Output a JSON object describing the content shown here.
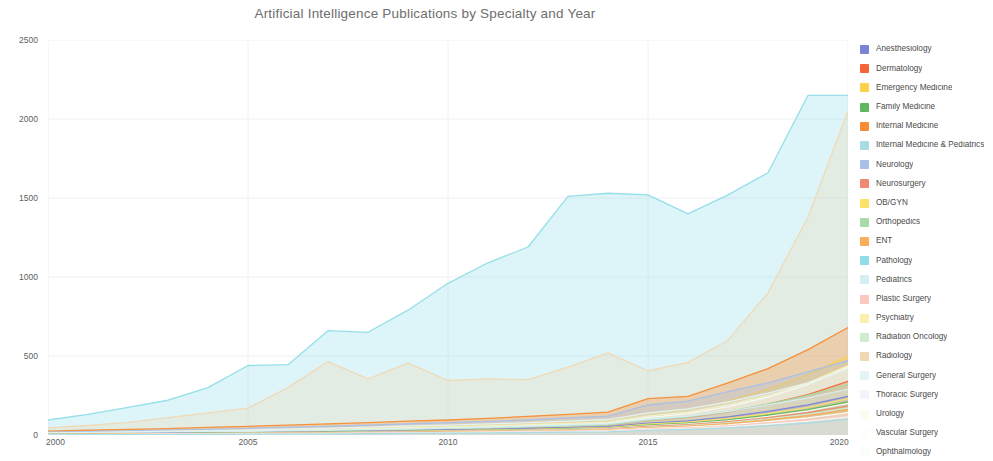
{
  "title": "Artificial Intelligence Publications by Specialty and Year",
  "axes": {
    "y_ticks": [
      0,
      500,
      1000,
      1500,
      2000,
      2500
    ],
    "x_ticks": [
      2000,
      2005,
      2010,
      2015,
      2020
    ]
  },
  "legend": {
    "position": "right",
    "items": [
      {
        "label": "Anesthesiology",
        "color": "#7b84d4"
      },
      {
        "label": "Dermatology",
        "color": "#f4663a"
      },
      {
        "label": "Emergency Medicine",
        "color": "#fbd04a"
      },
      {
        "label": "Family Medicine",
        "color": "#5fb85f"
      },
      {
        "label": "Internal Medicine",
        "color": "#f78c34"
      },
      {
        "label": "Internal Medicine & Pediatrics",
        "color": "#a8dbe3"
      },
      {
        "label": "Neurology",
        "color": "#a8c0e8"
      },
      {
        "label": "Neurosurgery",
        "color": "#f08a72"
      },
      {
        "label": "OB/GYN",
        "color": "#fbe26a"
      },
      {
        "label": "Orthopedics",
        "color": "#a8dba8"
      },
      {
        "label": "ENT",
        "color": "#f9ae5c"
      },
      {
        "label": "Pathology",
        "color": "#8fdde8"
      },
      {
        "label": "Pediatrics",
        "color": "#d4eef2"
      },
      {
        "label": "Plastic Surgery",
        "color": "#f9c9c0"
      },
      {
        "label": "Psychiatry",
        "color": "#fbefae"
      },
      {
        "label": "Radiation Oncology",
        "color": "#cfeccf"
      },
      {
        "label": "Radiology",
        "color": "#f0d8b4"
      },
      {
        "label": "General Surgery",
        "color": "#e4f4f6"
      },
      {
        "label": "Thoracic Surgery",
        "color": "#f2f6fb"
      },
      {
        "label": "Urology",
        "color": "#fdfaf0"
      },
      {
        "label": "Vascular Surgery",
        "color": "#fdfdfa"
      },
      {
        "label": "Ophthalmology",
        "color": "#fbfdfb"
      }
    ]
  },
  "chart_data": {
    "type": "area",
    "title": "Artificial Intelligence Publications by Specialty and Year",
    "xlabel": "",
    "ylabel": "",
    "xlim": [
      2000,
      2020
    ],
    "ylim": [
      0,
      2500
    ],
    "grid": true,
    "legend_position": "right",
    "x": [
      2000,
      2001,
      2002,
      2003,
      2004,
      2005,
      2006,
      2007,
      2008,
      2009,
      2010,
      2011,
      2012,
      2013,
      2014,
      2015,
      2016,
      2017,
      2018,
      2019,
      2020
    ],
    "series": [
      {
        "name": "Pathology",
        "color": "#8fdde8",
        "values": [
          95,
          130,
          175,
          220,
          300,
          440,
          445,
          660,
          650,
          790,
          960,
          1090,
          1190,
          1510,
          1530,
          1520,
          1400,
          1520,
          1660,
          2150,
          2150
        ]
      },
      {
        "name": "Radiology",
        "color": "#f0d8b4",
        "values": [
          45,
          60,
          80,
          110,
          140,
          170,
          300,
          465,
          355,
          455,
          345,
          355,
          350,
          430,
          520,
          405,
          460,
          600,
          900,
          1380,
          2050
        ]
      },
      {
        "name": "Internal Medicine",
        "color": "#f78c34",
        "values": [
          25,
          30,
          35,
          40,
          48,
          55,
          62,
          70,
          78,
          88,
          95,
          105,
          118,
          130,
          145,
          230,
          245,
          330,
          420,
          540,
          680
        ]
      },
      {
        "name": "Neurology",
        "color": "#a8c0e8",
        "values": [
          18,
          22,
          26,
          30,
          36,
          42,
          48,
          55,
          62,
          70,
          78,
          86,
          96,
          108,
          120,
          190,
          215,
          275,
          330,
          400,
          470
        ]
      },
      {
        "name": "Emergency Medicine",
        "color": "#fbd04a",
        "values": [
          12,
          15,
          18,
          22,
          26,
          30,
          34,
          40,
          45,
          52,
          58,
          64,
          72,
          80,
          90,
          135,
          160,
          215,
          290,
          380,
          500
        ]
      },
      {
        "name": "Psychiatry",
        "color": "#fbefae",
        "values": [
          10,
          13,
          16,
          19,
          23,
          27,
          31,
          36,
          41,
          47,
          52,
          58,
          65,
          73,
          82,
          120,
          145,
          190,
          250,
          330,
          440
        ]
      },
      {
        "name": "General Surgery",
        "color": "#e4f4f6",
        "values": [
          14,
          17,
          20,
          24,
          28,
          33,
          38,
          44,
          50,
          57,
          63,
          70,
          78,
          88,
          98,
          140,
          165,
          210,
          265,
          330,
          420
        ]
      },
      {
        "name": "Ophthalmology",
        "color": "#fbfdfb",
        "values": [
          8,
          10,
          12,
          15,
          18,
          21,
          25,
          29,
          34,
          39,
          44,
          50,
          57,
          65,
          74,
          110,
          135,
          180,
          240,
          320,
          430
        ]
      },
      {
        "name": "Dermatology",
        "color": "#f4663a",
        "values": [
          6,
          8,
          10,
          12,
          14,
          17,
          20,
          23,
          27,
          31,
          35,
          40,
          46,
          52,
          60,
          90,
          110,
          145,
          195,
          255,
          340
        ]
      },
      {
        "name": "Orthopedics",
        "color": "#a8dba8",
        "values": [
          7,
          9,
          11,
          13,
          16,
          19,
          22,
          26,
          30,
          34,
          39,
          44,
          50,
          57,
          65,
          95,
          115,
          150,
          195,
          250,
          320
        ]
      },
      {
        "name": "Pediatrics",
        "color": "#d4eef2",
        "values": [
          9,
          11,
          13,
          16,
          19,
          22,
          26,
          30,
          34,
          39,
          44,
          50,
          56,
          64,
          72,
          100,
          120,
          150,
          190,
          235,
          290
        ]
      },
      {
        "name": "Anesthesiology",
        "color": "#7b84d4",
        "values": [
          6,
          7,
          9,
          11,
          13,
          15,
          18,
          21,
          24,
          28,
          32,
          36,
          41,
          47,
          53,
          75,
          90,
          115,
          150,
          190,
          245
        ]
      },
      {
        "name": "OB/GYN",
        "color": "#fbe26a",
        "values": [
          5,
          6,
          8,
          9,
          11,
          13,
          16,
          18,
          21,
          24,
          28,
          32,
          36,
          41,
          47,
          68,
          82,
          105,
          135,
          175,
          230
        ]
      },
      {
        "name": "Family Medicine",
        "color": "#5fb85f",
        "values": [
          4,
          5,
          7,
          8,
          10,
          12,
          14,
          16,
          19,
          22,
          25,
          29,
          33,
          38,
          43,
          62,
          75,
          95,
          125,
          160,
          210
        ]
      },
      {
        "name": "Urology",
        "color": "#fdfaf0",
        "values": [
          4,
          5,
          6,
          8,
          9,
          11,
          13,
          15,
          18,
          21,
          24,
          27,
          31,
          36,
          41,
          58,
          70,
          90,
          118,
          152,
          200
        ]
      },
      {
        "name": "Neurosurgery",
        "color": "#f08a72",
        "values": [
          3,
          4,
          5,
          7,
          8,
          10,
          12,
          14,
          16,
          19,
          22,
          25,
          29,
          33,
          38,
          54,
          65,
          84,
          110,
          142,
          185
        ]
      },
      {
        "name": "Radiation Oncology",
        "color": "#cfeccf",
        "values": [
          3,
          4,
          5,
          6,
          8,
          9,
          11,
          13,
          15,
          18,
          20,
          23,
          27,
          31,
          35,
          50,
          60,
          78,
          102,
          132,
          172
        ]
      },
      {
        "name": "ENT",
        "color": "#f9ae5c",
        "values": [
          3,
          4,
          5,
          6,
          7,
          9,
          10,
          12,
          14,
          16,
          19,
          22,
          25,
          29,
          33,
          46,
          56,
          72,
          95,
          122,
          160
        ]
      },
      {
        "name": "Vascular Surgery",
        "color": "#fdfdfa",
        "values": [
          2,
          3,
          4,
          5,
          6,
          7,
          9,
          10,
          12,
          14,
          16,
          19,
          22,
          25,
          29,
          41,
          50,
          64,
          84,
          108,
          142
        ]
      },
      {
        "name": "Plastic Surgery",
        "color": "#f9c9c0",
        "values": [
          2,
          3,
          3,
          4,
          5,
          6,
          8,
          9,
          11,
          13,
          15,
          17,
          20,
          23,
          26,
          37,
          45,
          58,
          76,
          98,
          128
        ]
      },
      {
        "name": "Thoracic Surgery",
        "color": "#f2f6fb",
        "values": [
          2,
          2,
          3,
          4,
          5,
          6,
          7,
          8,
          10,
          11,
          13,
          15,
          18,
          20,
          23,
          33,
          40,
          52,
          68,
          88,
          115
        ]
      },
      {
        "name": "Internal Medicine & Pediatrics",
        "color": "#a8dbe3",
        "values": [
          1,
          2,
          2,
          3,
          4,
          5,
          6,
          7,
          8,
          10,
          11,
          13,
          15,
          18,
          20,
          29,
          35,
          45,
          59,
          76,
          100
        ]
      }
    ]
  }
}
